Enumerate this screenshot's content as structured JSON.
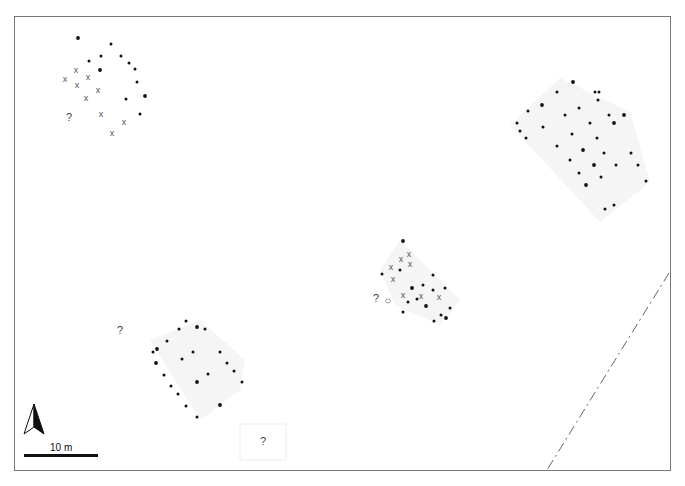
{
  "plan": {
    "title": "Site plan of post-built structures",
    "colors": {
      "frame": "#777777",
      "post": "#111111",
      "cross": "#555555",
      "question": "#444444",
      "shading": "#f4f4f4",
      "boundary": "#666666"
    },
    "scale_bar": {
      "label": "10 m"
    },
    "north_arrow": {
      "label": "N"
    },
    "symbols": {
      "post": "black dot = post hole",
      "cross": "x = uncertain/removed post",
      "question": "?"
    },
    "structures": [
      {
        "id": "structure-nw",
        "posts": [
          [
            78,
            38
          ],
          [
            111,
            44
          ],
          [
            121,
            56
          ],
          [
            89,
            61
          ],
          [
            101,
            56
          ],
          [
            100,
            70
          ],
          [
            129,
            63
          ],
          [
            135,
            69
          ],
          [
            137,
            82
          ],
          [
            126,
            99
          ],
          [
            145,
            96
          ],
          [
            140,
            114
          ]
        ],
        "crosses": [
          [
            76,
            70
          ],
          [
            65,
            79
          ],
          [
            88,
            77
          ],
          [
            77,
            85
          ],
          [
            98,
            90
          ],
          [
            86,
            98
          ],
          [
            101,
            114
          ],
          [
            124,
            122
          ],
          [
            112,
            133
          ]
        ],
        "questions": [
          [
            69,
            117
          ]
        ]
      },
      {
        "id": "structure-ne",
        "posts": [
          [
            573,
            82
          ],
          [
            557,
            92
          ],
          [
            595,
            92
          ],
          [
            599,
            92
          ],
          [
            598,
            100
          ],
          [
            542,
            105
          ],
          [
            528,
            111
          ],
          [
            579,
            108
          ],
          [
            565,
            115
          ],
          [
            609,
            115
          ],
          [
            624,
            115
          ],
          [
            517,
            123
          ],
          [
            520,
            131
          ],
          [
            543,
            127
          ],
          [
            590,
            123
          ],
          [
            614,
            123
          ],
          [
            526,
            138
          ],
          [
            572,
            134
          ],
          [
            597,
            138
          ],
          [
            557,
            146
          ],
          [
            583,
            150
          ],
          [
            604,
            153
          ],
          [
            570,
            160
          ],
          [
            631,
            153
          ],
          [
            638,
            165
          ],
          [
            594,
            165
          ],
          [
            616,
            165
          ],
          [
            579,
            173
          ],
          [
            601,
            177
          ],
          [
            646,
            181
          ],
          [
            586,
            185
          ],
          [
            614,
            205
          ],
          [
            605,
            209
          ]
        ],
        "crosses": [],
        "questions": []
      },
      {
        "id": "structure-center",
        "posts": [
          [
            403,
            241
          ],
          [
            400,
            270
          ],
          [
            382,
            274
          ],
          [
            433,
            275
          ],
          [
            423,
            285
          ],
          [
            412,
            288
          ],
          [
            433,
            290
          ],
          [
            445,
            288
          ],
          [
            408,
            302
          ],
          [
            417,
            299
          ],
          [
            426,
            306
          ],
          [
            403,
            312
          ],
          [
            450,
            308
          ],
          [
            441,
            315
          ],
          [
            434,
            321
          ],
          [
            446,
            318
          ]
        ],
        "crosses": [
          [
            409,
            254
          ],
          [
            401,
            259
          ],
          [
            410,
            264
          ],
          [
            391,
            267
          ],
          [
            393,
            279
          ],
          [
            403,
            295
          ],
          [
            421,
            296
          ],
          [
            439,
            297
          ]
        ],
        "questions": [
          [
            376,
            298
          ]
        ],
        "other": [
          [
            388,
            301
          ]
        ]
      },
      {
        "id": "structure-sw",
        "posts": [
          [
            197,
            327
          ],
          [
            186,
            321
          ],
          [
            179,
            329
          ],
          [
            205,
            329
          ],
          [
            167,
            341
          ],
          [
            157,
            349
          ],
          [
            153,
            352
          ],
          [
            193,
            352
          ],
          [
            220,
            352
          ],
          [
            182,
            359
          ],
          [
            156,
            363
          ],
          [
            227,
            363
          ],
          [
            234,
            371
          ],
          [
            164,
            375
          ],
          [
            208,
            374
          ],
          [
            197,
            382
          ],
          [
            242,
            382
          ],
          [
            171,
            386
          ],
          [
            178,
            394
          ],
          [
            186,
            406
          ],
          [
            220,
            405
          ],
          [
            197,
            417
          ]
        ],
        "crosses": [],
        "questions": [
          [
            120,
            330
          ]
        ]
      },
      {
        "id": "feature-s",
        "posts": [],
        "crosses": [],
        "questions": [
          [
            263,
            441
          ]
        ]
      }
    ]
  }
}
